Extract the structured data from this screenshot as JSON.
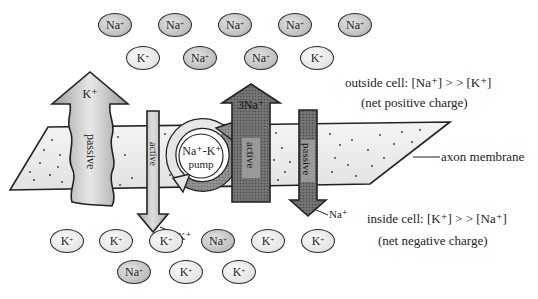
{
  "diagram": {
    "outside_ions": [
      {
        "type": "na",
        "label": "Na",
        "charge": "+",
        "x": 115,
        "y": 25
      },
      {
        "type": "na",
        "label": "Na",
        "charge": "+",
        "x": 175,
        "y": 25
      },
      {
        "type": "na",
        "label": "Na",
        "charge": "+",
        "x": 235,
        "y": 25
      },
      {
        "type": "na",
        "label": "Na",
        "charge": "+",
        "x": 295,
        "y": 25
      },
      {
        "type": "na",
        "label": "Na",
        "charge": "+",
        "x": 355,
        "y": 25
      },
      {
        "type": "k",
        "label": "K",
        "charge": "+",
        "x": 143,
        "y": 58
      },
      {
        "type": "na",
        "label": "Na",
        "charge": "+",
        "x": 200,
        "y": 58
      },
      {
        "type": "na",
        "label": "Na",
        "charge": "+",
        "x": 261,
        "y": 58
      },
      {
        "type": "k",
        "label": "K",
        "charge": "+",
        "x": 317,
        "y": 58
      }
    ],
    "inside_ions": [
      {
        "type": "k",
        "label": "K",
        "charge": "+",
        "x": 67,
        "y": 241
      },
      {
        "type": "k",
        "label": "K",
        "charge": "+",
        "x": 116,
        "y": 241
      },
      {
        "type": "k",
        "label": "K",
        "charge": "+",
        "x": 166,
        "y": 241
      },
      {
        "type": "na",
        "label": "Na",
        "charge": "+",
        "x": 218,
        "y": 241
      },
      {
        "type": "k",
        "label": "K",
        "charge": "+",
        "x": 268,
        "y": 241
      },
      {
        "type": "k",
        "label": "K",
        "charge": "+",
        "x": 318,
        "y": 241
      },
      {
        "type": "na",
        "label": "Na",
        "charge": "+",
        "x": 134,
        "y": 272
      },
      {
        "type": "k",
        "label": "K",
        "charge": "+",
        "x": 186,
        "y": 272
      },
      {
        "type": "k",
        "label": "K",
        "charge": "+",
        "x": 239,
        "y": 272
      }
    ],
    "outside_label": {
      "line1": "outside cell: [Na⁺] > > [K⁺]",
      "line2": "(net positive charge)"
    },
    "inside_label": {
      "line1": "inside cell: [K⁺] > > [Na⁺]",
      "line2": "(net negative charge)"
    },
    "membrane_label": "axon membrane",
    "arrows": {
      "k_passive": {
        "ion": "K⁺",
        "mode": "passive"
      },
      "k_active": {
        "ion": "2K⁺",
        "mode": "active"
      },
      "pump": {
        "line1": "Na⁺-K⁺",
        "line2": "pump"
      },
      "na_active": {
        "ion": "3Na⁺",
        "mode": "active"
      },
      "na_passive": {
        "ion": "Na⁺",
        "mode": "passive"
      }
    }
  }
}
